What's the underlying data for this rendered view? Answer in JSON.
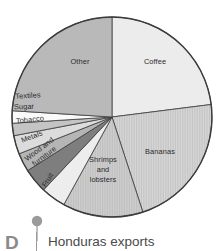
{
  "caption": {
    "marker_letter": "D",
    "title": "Honduras exports",
    "marker_icon": "map-pin-icon",
    "marker_color": "#9a9a9a",
    "letter_color": "#8a8a8a",
    "title_color": "#4a4a4a"
  },
  "chart_data": {
    "type": "pie",
    "title": "Honduras exports",
    "subtitle": "",
    "xlabel": "",
    "ylabel": "",
    "grid": false,
    "legend": "none (labels drawn on slices)",
    "start_angle_deg": 0,
    "direction": "clockwise",
    "center_px": [
      112,
      117
    ],
    "radius_px": 100,
    "outline_color": "#3c3c3c",
    "categories": [
      "Coffee",
      "Bananas",
      "Shrimps and lobsters",
      "Fruit",
      "Wood and furniture",
      "Metals",
      "Tobacco",
      "Sugar",
      "Textiles",
      "Other"
    ],
    "values": [
      23,
      22,
      13,
      4,
      4,
      3,
      3,
      2,
      2,
      24
    ],
    "slices": [
      {
        "label": "Coffee",
        "value": 23,
        "start_deg": 0,
        "end_deg": 82.8,
        "color": "#ececec",
        "pattern": "solid",
        "label_placement": "inside",
        "label_lines": [
          "Coffee"
        ]
      },
      {
        "label": "Bananas",
        "value": 22,
        "start_deg": 82.8,
        "end_deg": 162.0,
        "color": "#d2d2d2",
        "pattern": "vertical-hatch",
        "label_placement": "inside",
        "label_lines": [
          "Bananas"
        ]
      },
      {
        "label": "Shrimps and lobsters",
        "value": 13,
        "start_deg": 162.0,
        "end_deg": 208.8,
        "color": "#c9c9c9",
        "pattern": "vertical-hatch",
        "label_placement": "inside",
        "label_lines": [
          "Shrimps",
          "and",
          "lobsters"
        ]
      },
      {
        "label": "Fruit",
        "value": 4,
        "start_deg": 208.8,
        "end_deg": 223.2,
        "color": "#ededed",
        "pattern": "solid",
        "label_placement": "inside-rotated",
        "label_lines": [
          "Fruit"
        ]
      },
      {
        "label": "Wood and furniture",
        "value": 4,
        "start_deg": 223.2,
        "end_deg": 237.6,
        "color": "#7e7e7e",
        "pattern": "solid",
        "label_placement": "inside-rotated",
        "label_lines": [
          "Wood and",
          "furniture"
        ]
      },
      {
        "label": "Metals",
        "value": 3,
        "start_deg": 237.6,
        "end_deg": 248.4,
        "color": "#b5b5b5",
        "pattern": "solid",
        "label_placement": "inside-rotated",
        "label_lines": [
          "Metals"
        ]
      },
      {
        "label": "Tobacco",
        "value": 3,
        "start_deg": 248.4,
        "end_deg": 259.2,
        "color": "#dcdcdc",
        "pattern": "solid",
        "label_placement": "inside",
        "label_lines": [
          "Tobacco"
        ]
      },
      {
        "label": "Sugar",
        "value": 2,
        "start_deg": 259.2,
        "end_deg": 266.4,
        "color": "#c4c4c4",
        "pattern": "solid",
        "label_placement": "inside",
        "label_lines": [
          "Sugar"
        ]
      },
      {
        "label": "Textiles",
        "value": 2,
        "start_deg": 266.4,
        "end_deg": 273.6,
        "color": "#fafafa",
        "pattern": "solid",
        "label_placement": "inside",
        "label_lines": [
          "Textiles"
        ]
      },
      {
        "label": "Other",
        "value": 24,
        "start_deg": 273.6,
        "end_deg": 360.0,
        "color": "#b9b9b9",
        "pattern": "solid",
        "label_placement": "inside",
        "label_lines": [
          "Other"
        ]
      }
    ]
  }
}
